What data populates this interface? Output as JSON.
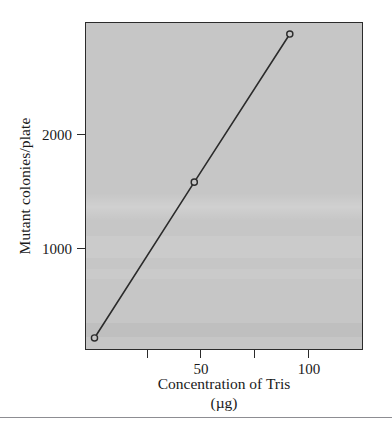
{
  "chart_data": {
    "type": "line",
    "title": "",
    "xlabel": "Concentration of Tris",
    "xlabel_unit": "(µg)",
    "ylabel": "Mutant colonies/plate",
    "xlim": [
      -4,
      126
    ],
    "ylim": [
      0,
      2950
    ],
    "grid": false,
    "legend": "none",
    "marker": "open-circle",
    "series": [
      {
        "name": "Mutant colonies per plate vs Tris concentration",
        "x": [
          0,
          47,
          92
        ],
        "y": [
          100,
          1510,
          2850
        ]
      }
    ],
    "x_ticks": [
      {
        "value": 25,
        "label": ""
      },
      {
        "value": 50,
        "label": "50"
      },
      {
        "value": 75,
        "label": ""
      },
      {
        "value": 100,
        "label": "100"
      }
    ],
    "y_ticks": [
      {
        "value": 1000,
        "label": "1000"
      },
      {
        "value": 2000,
        "label": "2000"
      }
    ],
    "colors": {
      "plot_background": "#c6c6c6",
      "page_background": "#ffffff",
      "axis": "#2b2b2b",
      "line": "#2b2b2b",
      "marker_fill": "#c6c6c6",
      "text": "#1a1a1a",
      "rule": "#8d8d92"
    }
  }
}
